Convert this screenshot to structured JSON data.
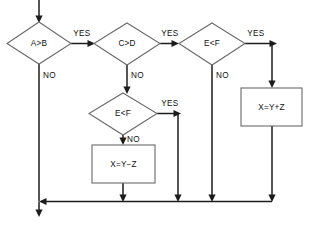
{
  "diagram": {
    "type": "flowchart",
    "colors": {
      "background": "#ffffff",
      "shape_stroke": "#6a6a6a",
      "shape_fill": "#ffffff",
      "connector": "#1c1c1c",
      "text": "#101010"
    },
    "nodes": [
      {
        "id": "d1",
        "shape": "diamond",
        "label": "A>B",
        "cx": 39,
        "cy": 43,
        "rx": 32,
        "ry": 21
      },
      {
        "id": "d2",
        "shape": "diamond",
        "label": "C>D",
        "cx": 127,
        "cy": 44,
        "rx": 33,
        "ry": 21
      },
      {
        "id": "d3",
        "shape": "diamond",
        "label": "E<F",
        "cx": 212,
        "cy": 44,
        "rx": 33,
        "ry": 21
      },
      {
        "id": "d4",
        "shape": "diamond",
        "label": "E<F",
        "cx": 123,
        "cy": 114,
        "rx": 34,
        "ry": 21
      },
      {
        "id": "p1",
        "shape": "process",
        "label": "X=Y+Z",
        "x": 241,
        "y": 88,
        "w": 61,
        "h": 38
      },
      {
        "id": "p2",
        "shape": "process",
        "label": "X=Y−Z",
        "x": 92,
        "y": 145,
        "w": 63,
        "h": 38
      }
    ],
    "edge_labels": [
      {
        "id": "yes1",
        "text": "YES",
        "x": 82,
        "y": 36,
        "anchor": "middle"
      },
      {
        "id": "no1",
        "text": "NO",
        "x": 43,
        "y": 75,
        "anchor": "start"
      },
      {
        "id": "yes2",
        "text": "YES",
        "x": 170,
        "y": 36,
        "anchor": "middle"
      },
      {
        "id": "no2",
        "text": "NO",
        "x": 127,
        "y": 75,
        "anchor": "start"
      },
      {
        "id": "yes3",
        "text": "YES",
        "x": 254,
        "y": 36,
        "anchor": "middle"
      },
      {
        "id": "no3",
        "text": "NO",
        "x": 212,
        "y": 75,
        "anchor": "start"
      },
      {
        "id": "yes4",
        "text": "YES",
        "x": 172,
        "y": 103,
        "anchor": "middle"
      },
      {
        "id": "no4",
        "text": "NO",
        "x": 127,
        "y": 136,
        "anchor": "start"
      }
    ],
    "connections": [
      {
        "id": "entry",
        "from": "start",
        "to": "d1",
        "label": ""
      },
      {
        "id": "d1-yes-d2",
        "from": "d1",
        "to": "d2",
        "label": "YES"
      },
      {
        "id": "d1-no-exit",
        "from": "d1",
        "to": "merge",
        "label": "NO"
      },
      {
        "id": "d2-yes-d3",
        "from": "d2",
        "to": "d3",
        "label": "YES"
      },
      {
        "id": "d2-no-d4",
        "from": "d2",
        "to": "d4",
        "label": "NO"
      },
      {
        "id": "d3-yes-p1",
        "from": "d3",
        "to": "p1",
        "label": "YES"
      },
      {
        "id": "d3-no-merge",
        "from": "d3",
        "to": "merge",
        "label": "NO"
      },
      {
        "id": "d4-yes-merge",
        "from": "d4",
        "to": "merge",
        "label": "YES"
      },
      {
        "id": "d4-no-p2",
        "from": "d4",
        "to": "p2",
        "label": "NO"
      },
      {
        "id": "p1-merge",
        "from": "p1",
        "to": "merge",
        "label": ""
      },
      {
        "id": "p2-merge",
        "from": "p2",
        "to": "merge",
        "label": ""
      },
      {
        "id": "merge-exit",
        "from": "merge",
        "to": "end",
        "label": ""
      }
    ]
  }
}
